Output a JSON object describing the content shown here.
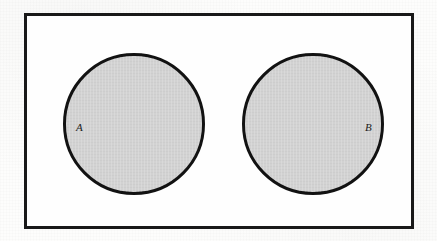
{
  "figure": {
    "kind": "venn-diagram",
    "relationship": "disjoint",
    "background_color": "#fdfdfc"
  },
  "universe": {
    "name": "universal-set-rectangle",
    "border_color": "#191919",
    "fill_color": "#fefefe",
    "border_width_px": 3,
    "x": 24,
    "y": 13,
    "width": 390,
    "height": 216
  },
  "sets": [
    {
      "id": "A",
      "label": "A",
      "label_style": "italic",
      "fill_color": "#d2d2d2",
      "stroke_color": "#121212",
      "stroke_width_px": 3,
      "center_x": 131,
      "center_y": 121,
      "diameter_px": 142,
      "label_x": 73,
      "label_y": 119
    },
    {
      "id": "B",
      "label": "B",
      "label_style": "italic",
      "fill_color": "#d2d2d2",
      "stroke_color": "#121212",
      "stroke_width_px": 3,
      "center_x": 310,
      "center_y": 121,
      "diameter_px": 142,
      "label_x": 362,
      "label_y": 119
    }
  ]
}
